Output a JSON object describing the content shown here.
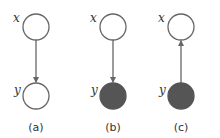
{
  "colors": {
    "stroke": "#666666",
    "observed_fill": "#555555",
    "latent_fill": "#ffffff"
  },
  "panels": [
    {
      "caption": "(a)",
      "top_var": "x",
      "bottom_var": "y",
      "top_observed": false,
      "bottom_observed": false,
      "edge": "x->y"
    },
    {
      "caption": "(b)",
      "top_var": "x",
      "bottom_var": "y",
      "top_observed": false,
      "bottom_observed": true,
      "edge": "x->y"
    },
    {
      "caption": "(c)",
      "top_var": "x",
      "bottom_var": "y",
      "top_observed": false,
      "bottom_observed": true,
      "edge": "y->x"
    }
  ]
}
